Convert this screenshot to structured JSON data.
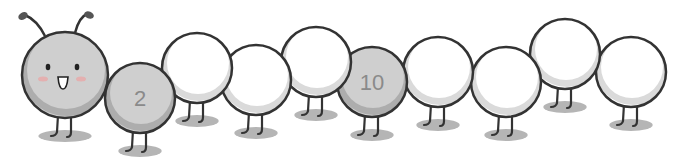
{
  "scene": {
    "description": "Cartoon caterpillar made of connected circles; head plus 9 body segments, two segments labeled with numbers",
    "colors": {
      "outline": "#333333",
      "gray_fill": "#cfcfcf",
      "gray_shade": "#a9a9a9",
      "white_fill": "#ffffff",
      "white_shade": "#d6d6d6",
      "shadow": "#b5b5b5",
      "number": "#8a8a8a",
      "blush": "#e8a8a8"
    },
    "head": {
      "cx": 65,
      "cy": 75,
      "r": 43
    },
    "segments": [
      {
        "index": 1,
        "cx": 140,
        "cy": 98,
        "r": 35,
        "fill": "gray",
        "label": "2"
      },
      {
        "index": 2,
        "cx": 197,
        "cy": 68,
        "r": 35,
        "fill": "white",
        "label": ""
      },
      {
        "index": 3,
        "cx": 256,
        "cy": 80,
        "r": 35,
        "fill": "white",
        "label": ""
      },
      {
        "index": 4,
        "cx": 316,
        "cy": 62,
        "r": 35,
        "fill": "white",
        "label": ""
      },
      {
        "index": 5,
        "cx": 372,
        "cy": 82,
        "r": 35,
        "fill": "gray",
        "label": "10"
      },
      {
        "index": 6,
        "cx": 438,
        "cy": 72,
        "r": 35,
        "fill": "white",
        "label": ""
      },
      {
        "index": 7,
        "cx": 506,
        "cy": 82,
        "r": 35,
        "fill": "white",
        "label": ""
      },
      {
        "index": 8,
        "cx": 565,
        "cy": 54,
        "r": 35,
        "fill": "white",
        "label": ""
      },
      {
        "index": 9,
        "cx": 631,
        "cy": 72,
        "r": 35,
        "fill": "white",
        "label": ""
      }
    ]
  }
}
